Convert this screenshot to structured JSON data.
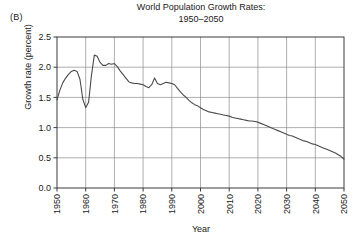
{
  "figure": {
    "panel_label": "(B)",
    "title_line1": "World Population Growth Rates:",
    "title_line2": "1950–2050"
  },
  "chart_data": {
    "type": "line",
    "title": "World Population Growth Rates: 1950–2050",
    "xlabel": "Year",
    "ylabel": "Growth rate (percent)",
    "xlim": [
      1950,
      2050
    ],
    "ylim": [
      0.0,
      2.5
    ],
    "grid": true,
    "legend": "none",
    "xticks": [
      1950,
      1960,
      1970,
      1980,
      1990,
      2000,
      2010,
      2020,
      2030,
      2040,
      2050
    ],
    "xticklabels": [
      "1950",
      "1960",
      "1970",
      "1980",
      "1990",
      "2000",
      "2010",
      "2020",
      "2030",
      "2040",
      "2050"
    ],
    "xtick_rotation": 90,
    "yticks": [
      0.0,
      0.5,
      1.0,
      1.5,
      2.0,
      2.5
    ],
    "yticklabels": [
      "0.0",
      "0.5",
      "1.0",
      "1.5",
      "2.0",
      "2.5"
    ],
    "series": [
      {
        "name": "World population growth rate",
        "color": "#4a4a4a",
        "x": [
          1950,
          1951,
          1952,
          1953,
          1954,
          1955,
          1956,
          1957,
          1958,
          1959,
          1960,
          1961,
          1962,
          1963,
          1964,
          1965,
          1966,
          1967,
          1968,
          1969,
          1970,
          1971,
          1972,
          1973,
          1974,
          1975,
          1976,
          1977,
          1978,
          1979,
          1980,
          1981,
          1982,
          1983,
          1984,
          1985,
          1986,
          1987,
          1988,
          1989,
          1990,
          1991,
          1992,
          1993,
          1994,
          1995,
          1996,
          1997,
          1998,
          1999,
          2000,
          2001,
          2002,
          2003,
          2004,
          2005,
          2006,
          2007,
          2008,
          2009,
          2010,
          2011,
          2012,
          2013,
          2014,
          2015,
          2016,
          2017,
          2018,
          2019,
          2020,
          2021,
          2022,
          2023,
          2024,
          2025,
          2026,
          2027,
          2028,
          2029,
          2030,
          2031,
          2032,
          2033,
          2034,
          2035,
          2036,
          2037,
          2038,
          2039,
          2040,
          2041,
          2042,
          2043,
          2044,
          2045,
          2046,
          2047,
          2048,
          2049,
          2050
        ],
        "y": [
          1.46,
          1.62,
          1.74,
          1.82,
          1.88,
          1.93,
          1.95,
          1.93,
          1.8,
          1.47,
          1.33,
          1.42,
          1.86,
          2.2,
          2.18,
          2.08,
          2.03,
          2.03,
          2.06,
          2.05,
          2.06,
          2.01,
          1.94,
          1.88,
          1.82,
          1.76,
          1.74,
          1.73,
          1.73,
          1.72,
          1.71,
          1.68,
          1.66,
          1.71,
          1.82,
          1.73,
          1.71,
          1.73,
          1.75,
          1.74,
          1.73,
          1.71,
          1.65,
          1.59,
          1.54,
          1.5,
          1.45,
          1.41,
          1.38,
          1.36,
          1.33,
          1.3,
          1.28,
          1.26,
          1.25,
          1.24,
          1.23,
          1.22,
          1.21,
          1.2,
          1.19,
          1.17,
          1.16,
          1.15,
          1.14,
          1.13,
          1.12,
          1.11,
          1.11,
          1.1,
          1.09,
          1.07,
          1.05,
          1.03,
          1.01,
          0.99,
          0.97,
          0.95,
          0.93,
          0.91,
          0.89,
          0.87,
          0.86,
          0.84,
          0.82,
          0.8,
          0.78,
          0.77,
          0.75,
          0.73,
          0.72,
          0.7,
          0.68,
          0.66,
          0.64,
          0.62,
          0.6,
          0.58,
          0.55,
          0.52,
          0.48
        ]
      }
    ],
    "annotations": [
      {
        "text": "(B)",
        "role": "panel-label"
      }
    ]
  }
}
